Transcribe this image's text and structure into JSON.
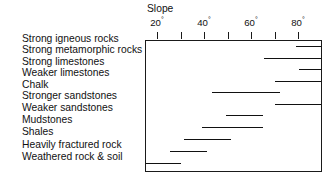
{
  "figure": {
    "axis_title": "Slope",
    "frame": {
      "left_px": 145,
      "top_px": 40,
      "width_px": 177,
      "height_px": 132
    },
    "scale": {
      "deg_at_left_edge": 15,
      "px_per_degree": 2.35
    }
  },
  "axis": {
    "ticks_labeled": [
      "20",
      "40",
      "60",
      "80"
    ],
    "degree_symbol": "°",
    "ticks_all_deg": [
      20,
      30,
      40,
      50,
      60,
      70,
      80
    ]
  },
  "chart_data": {
    "type": "bar",
    "title": "Slope",
    "xlabel": "Slope",
    "ylabel": "",
    "orientation": "horizontal",
    "bar_style": "range",
    "units": "degrees",
    "xlim": [
      15,
      92
    ],
    "grid": false,
    "legend": "none",
    "axis_position": "top",
    "tick_labels": [
      "20°",
      "40°",
      "60°",
      "80°"
    ],
    "tick_values": [
      20,
      40,
      60,
      80
    ],
    "minor_tick_values": [
      30,
      50,
      70
    ],
    "categories": [
      "Strong igneous rocks",
      "Strong metamorphic rocks",
      "Strong limestones",
      "Weaker limestones",
      "Chalk",
      "Stronger sandstones",
      "Weaker sandstones",
      "Mudstones",
      "Shales",
      "Heavily fractured rock",
      "Weathered rock & soil"
    ],
    "ranges": [
      {
        "label": "Strong igneous rocks",
        "min": 79,
        "max": 92,
        "clipped_right": true,
        "clipped_left": false
      },
      {
        "label": "Strong metamorphic rocks",
        "min": 65,
        "max": 92,
        "clipped_right": true,
        "clipped_left": false
      },
      {
        "label": "Strong limestones",
        "min": 80,
        "max": 92,
        "clipped_right": true,
        "clipped_left": false
      },
      {
        "label": "Weaker limestones",
        "min": 70,
        "max": 92,
        "clipped_right": true,
        "clipped_left": false
      },
      {
        "label": "Chalk",
        "min": 43,
        "max": 72,
        "clipped_right": false,
        "clipped_left": false
      },
      {
        "label": "Stronger sandstones",
        "min": 70,
        "max": 92,
        "clipped_right": true,
        "clipped_left": false
      },
      {
        "label": "Weaker sandstones",
        "min": 49,
        "max": 65,
        "clipped_right": false,
        "clipped_left": false
      },
      {
        "label": "Mudstones",
        "min": 39,
        "max": 65,
        "clipped_right": false,
        "clipped_left": false
      },
      {
        "label": "Shales",
        "min": 31,
        "max": 51,
        "clipped_right": false,
        "clipped_left": false
      },
      {
        "label": "Heavily fractured rock",
        "min": 25,
        "max": 41,
        "clipped_right": false,
        "clipped_left": false
      },
      {
        "label": "Weathered rock & soil",
        "min": 15,
        "max": 30,
        "clipped_right": false,
        "clipped_left": true
      }
    ]
  },
  "layout": {
    "label_tops_px": [
      33,
      44,
      56,
      67,
      79,
      90,
      102,
      114,
      126,
      139,
      151
    ],
    "bar_tops_px": [
      45,
      57,
      68,
      80,
      91,
      103,
      114,
      126,
      138,
      150,
      162
    ],
    "tick_x_px": [
      157.0,
      180.5,
      204.0,
      227.5,
      251.0,
      274.5,
      298.0
    ],
    "label_x_px": [
      157.0,
      204.0,
      251.0,
      298.0
    ]
  },
  "colors": {
    "background": "#ffffff",
    "ink": "#1a1a1a",
    "text": "#111111",
    "frame": "#1a1a1a"
  }
}
